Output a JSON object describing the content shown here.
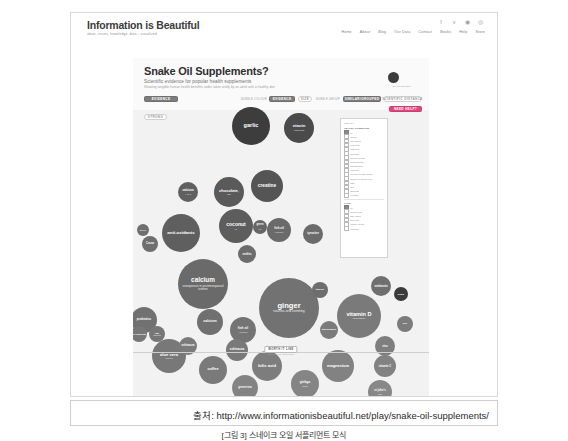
{
  "site": {
    "logo_title": "Information is Beautiful",
    "logo_tagline": "ideas, issues, knowledge, data – visualized",
    "social": [
      "f",
      "ᴠ",
      "ⓖ",
      "▭"
    ],
    "nav": [
      "Home",
      "About",
      "Blog",
      "Our Data",
      "Contact",
      "Books",
      "Help",
      "Store"
    ]
  },
  "viz": {
    "title": "Snake Oil Supplements?",
    "subtitle": "Scientific evidence for popular health supplements",
    "subtitle2": "Showing tangible human health benefits under taken orally by an adult with a healthy diet",
    "data_dot_label": "size for popularity",
    "controls": {
      "evidence": "EVIDENCE",
      "popularity_prefix": "BUBBLE COLOUR",
      "popularity": "EVIDENCE",
      "size": "SIZE",
      "grouping_prefix": "BUBBLE GROUP",
      "grouping": "SIMILAR/GROUPED",
      "distance": "SCIENTIFIC DISTANCE",
      "help": "NEED HELP?",
      "strong": "STRONG"
    },
    "worth_it_line": "WORTH IT LINE",
    "worth_it_sub": "above this line, worth taking"
  },
  "filter_panel": {
    "title": "filter by:",
    "group1_head": "HEALTH CONDITION",
    "group1": [
      {
        "label": "all",
        "checked": true
      },
      {
        "label": "cancer",
        "checked": false
      },
      {
        "label": "cholesterol",
        "checked": false
      },
      {
        "label": "cold & flu",
        "checked": false
      },
      {
        "label": "diabetes",
        "checked": false
      },
      {
        "label": "digestion",
        "checked": false
      },
      {
        "label": "general health",
        "checked": false
      },
      {
        "label": "heart disease",
        "checked": false
      },
      {
        "label": "inflammation",
        "checked": false
      },
      {
        "label": "immunity",
        "checked": false
      },
      {
        "label": "mood & mental health",
        "checked": false
      },
      {
        "label": "muscle & athletic perf.",
        "checked": false
      },
      {
        "label": "pain",
        "checked": false
      },
      {
        "label": "skin",
        "checked": false
      },
      {
        "label": "sickness",
        "checked": false
      },
      {
        "label": "prostate",
        "checked": false
      }
    ],
    "group2_head": "TYPE",
    "group2": [
      {
        "label": "all",
        "checked": true
      },
      {
        "label": "amino acids",
        "checked": false
      },
      {
        "label": "fatty acids",
        "checked": false
      },
      {
        "label": "minerals",
        "checked": false
      },
      {
        "label": "plants / foods",
        "checked": false
      },
      {
        "label": "vitamins",
        "checked": false
      }
    ]
  },
  "chart_data": {
    "type": "scatter",
    "title": "Snake Oil Supplements?",
    "xlabel": "",
    "ylabel": "strength of scientific evidence",
    "note": "Bubble size = popularity. Higher = stronger evidence.",
    "bubbles": [
      {
        "name": "garlic",
        "sub": "",
        "x": 118,
        "y": 68,
        "r": 19,
        "color": "#3d3d3d",
        "fs": 5.6,
        "tc": "#ffffff"
      },
      {
        "name": "niacin",
        "sub": "(vitamin B3)",
        "x": 166,
        "y": 70,
        "r": 15,
        "color": "#4a4a4a",
        "fs": 4.4,
        "tc": "#ffffff"
      },
      {
        "name": "creatine",
        "sub": "",
        "x": 134,
        "y": 128,
        "r": 16,
        "color": "#555555",
        "fs": 4.8,
        "tc": "#ffffff"
      },
      {
        "name": "chocolate,",
        "sub": "dark",
        "x": 96,
        "y": 134,
        "r": 15,
        "color": "#5a5a5a",
        "fs": 4.0,
        "tc": "#ffffff"
      },
      {
        "name": "calcium",
        "sub": "+ vit. D",
        "x": 55,
        "y": 134,
        "r": 10,
        "color": "#606060",
        "fs": 3.0,
        "tc": "#ffffff"
      },
      {
        "name": "coconut",
        "sub": "oil",
        "x": 103,
        "y": 168,
        "r": 17,
        "color": "#5d5d5d",
        "fs": 5.0,
        "tc": "#ffffff"
      },
      {
        "name": "anti-oxidants",
        "sub": "",
        "x": 48,
        "y": 175,
        "r": 19,
        "color": "#5f5f5f",
        "fs": 4.4,
        "tc": "#ffffff"
      },
      {
        "name": "fish oil",
        "sub": "/ omega 3",
        "x": 146,
        "y": 172,
        "r": 12,
        "color": "#6a6a6a",
        "fs": 3.0,
        "tc": "#ffffff"
      },
      {
        "name": "green",
        "sub": "tea",
        "x": 127,
        "y": 169,
        "r": 7,
        "color": "#676767",
        "fs": 2.6,
        "tc": "#ffffff"
      },
      {
        "name": "nettles",
        "sub": "",
        "x": 114,
        "y": 196,
        "r": 9,
        "color": "#6c6c6c",
        "fs": 2.8,
        "tc": "#ffffff"
      },
      {
        "name": "tyrosine",
        "sub": "",
        "x": 180,
        "y": 176,
        "r": 10,
        "color": "#6b6b6b",
        "fs": 3.0,
        "tc": "#ffffff"
      },
      {
        "name": "Cocoa",
        "sub": "",
        "x": 17,
        "y": 186,
        "r": 8,
        "color": "#6e6e6e",
        "fs": 2.6,
        "tc": "#ffffff"
      },
      {
        "name": "SOYA",
        "sub": "",
        "x": 10,
        "y": 172,
        "r": 6,
        "color": "#6f6f6f",
        "fs": 2.3,
        "tc": "#ffffff"
      },
      {
        "name": "calcium",
        "sub": "osteoporosis in postmenopausal women",
        "x": 70,
        "y": 226,
        "r": 25,
        "color": "#6a6a6a",
        "fs": 6.4,
        "tc": "#ffffff"
      },
      {
        "name": "ginger",
        "sub": "nausea and vomiting",
        "x": 156,
        "y": 250,
        "r": 30,
        "color": "#727272",
        "fs": 7.6,
        "tc": "#ffffff"
      },
      {
        "name": "vitamin D",
        "sub": "depression",
        "x": 226,
        "y": 258,
        "r": 22,
        "color": "#7a7a7a",
        "fs": 5.6,
        "tc": "#ffffff"
      },
      {
        "name": "calcium",
        "sub": "",
        "x": 77,
        "y": 264,
        "r": 13,
        "color": "#707070",
        "fs": 3.6,
        "tc": "#ffffff"
      },
      {
        "name": "fish oil",
        "sub": "/ omega 3",
        "x": 110,
        "y": 272,
        "r": 13,
        "color": "#747474",
        "fs": 3.2,
        "tc": "#ffffff"
      },
      {
        "name": "aloe vera",
        "sub": "eczema",
        "x": 36,
        "y": 298,
        "r": 17,
        "color": "#787878",
        "fs": 4.2,
        "tc": "#ffffff"
      },
      {
        "name": "coffee",
        "sub": "",
        "x": 80,
        "y": 312,
        "r": 14,
        "color": "#7a7a7a",
        "fs": 3.8,
        "tc": "#ffffff"
      },
      {
        "name": "folic acid",
        "sub": "",
        "x": 134,
        "y": 308,
        "r": 15,
        "color": "#7d7d7d",
        "fs": 4.2,
        "tc": "#ffffff"
      },
      {
        "name": "magnesium",
        "sub": "",
        "x": 205,
        "y": 308,
        "r": 16,
        "color": "#828282",
        "fs": 4.0,
        "tc": "#ffffff"
      },
      {
        "name": "echinacea",
        "sub": "",
        "x": 104,
        "y": 292,
        "r": 11,
        "color": "#797979",
        "fs": 3.0,
        "tc": "#ffffff"
      },
      {
        "name": "echinacea",
        "sub": "",
        "x": 55,
        "y": 288,
        "r": 9,
        "color": "#7b7b7b",
        "fs": 2.7,
        "tc": "#ffffff"
      },
      {
        "name": "probiotics",
        "sub": "",
        "x": 11,
        "y": 262,
        "r": 13,
        "color": "#717171",
        "fs": 3.0,
        "tc": "#ffffff"
      },
      {
        "name": "MAGNESIUM",
        "sub": "",
        "x": 6,
        "y": 276,
        "r": 8,
        "color": "#767676",
        "fs": 2.2,
        "tc": "#ffffff"
      },
      {
        "name": "saw",
        "sub": "palmetto",
        "x": 24,
        "y": 276,
        "r": 8,
        "color": "#767676",
        "fs": 2.2,
        "tc": "#ffffff"
      },
      {
        "name": "melatonin",
        "sub": "",
        "x": 248,
        "y": 228,
        "r": 10,
        "color": "#6f6f6f",
        "fs": 2.8,
        "tc": "#ffffff"
      },
      {
        "name": "taurine",
        "sub": "",
        "x": 187,
        "y": 232,
        "r": 8,
        "color": "#6d6d6d",
        "fs": 2.5,
        "tc": "#ffffff"
      },
      {
        "name": "biotin",
        "sub": "",
        "x": 268,
        "y": 236,
        "r": 7,
        "color": "#3a3a3a",
        "fs": 2.3,
        "tc": "#ffffff"
      },
      {
        "name": "glucosamine",
        "sub": "",
        "x": 196,
        "y": 272,
        "r": 9,
        "color": "#7b7b7b",
        "fs": 2.4,
        "tc": "#ffffff"
      },
      {
        "name": "zinc",
        "sub": "",
        "x": 252,
        "y": 288,
        "r": 10,
        "color": "#7e7e7e",
        "fs": 2.8,
        "tc": "#ffffff"
      },
      {
        "name": "vitamin C",
        "sub": "",
        "x": 252,
        "y": 308,
        "r": 11,
        "color": "#828282",
        "fs": 2.8,
        "tc": "#ffffff"
      },
      {
        "name": "soy",
        "sub": "",
        "x": 272,
        "y": 266,
        "r": 8,
        "color": "#7c7c7c",
        "fs": 2.5,
        "tc": "#ffffff"
      },
      {
        "name": "ginkgo",
        "sub": "biloba",
        "x": 172,
        "y": 326,
        "r": 14,
        "color": "#858585",
        "fs": 3.2,
        "tc": "#ffffff"
      },
      {
        "name": "green tea",
        "sub": "",
        "x": 112,
        "y": 330,
        "r": 13,
        "color": "#838383",
        "fs": 3.0,
        "tc": "#ffffff"
      },
      {
        "name": "st john's",
        "sub": "wort",
        "x": 247,
        "y": 334,
        "r": 12,
        "color": "#888888",
        "fs": 2.8,
        "tc": "#ffffff"
      }
    ]
  },
  "caption": {
    "source": "출처: http://www.informationisbeautiful.net/play/snake-oil-supplements/",
    "figure": "[그림 3] 스네이크 오일 서플리먼트 모식"
  }
}
